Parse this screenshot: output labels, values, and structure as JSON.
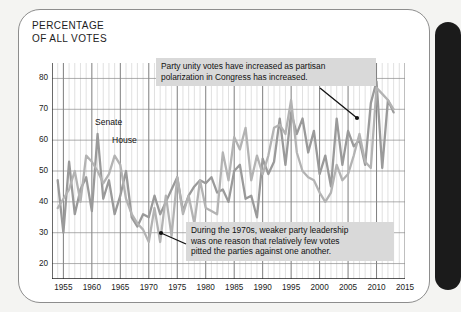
{
  "page": {
    "title_line": "PERCENTAGE\nOF ALL VOTES",
    "binding_color": "#1b1b1b",
    "card_bg": "#ffffff"
  },
  "annotations": [
    {
      "id": "note-polarization",
      "text": "Party unity votes have increased as partisan\npolarization in Congress has increased.",
      "bg": "#d9d9d9"
    },
    {
      "id": "note-1970s",
      "text": "During the 1970s, weaker party leadership\nwas one reason that relatively few votes\npitted the parties against one another.",
      "bg": "#d9d9d9"
    }
  ],
  "series_labels": {
    "senate": "Senate",
    "house": "House"
  },
  "chart_data": {
    "type": "line",
    "title": "PERCENTAGE OF ALL VOTES",
    "xlabel": "",
    "ylabel": "PERCENTAGE OF ALL VOTES",
    "xlim": [
      1953,
      2015
    ],
    "ylim": [
      15,
      85
    ],
    "yticks": [
      20,
      30,
      40,
      50,
      60,
      70,
      80
    ],
    "xticks": [
      1955,
      1960,
      1965,
      1970,
      1975,
      1980,
      1985,
      1990,
      1995,
      2000,
      2005,
      2010,
      2015
    ],
    "grid": "minor-vertical-yearly major-every-5-years horizontal-at-yticks",
    "legend": "inline-labels",
    "x": [
      1954,
      1955,
      1956,
      1957,
      1958,
      1959,
      1960,
      1961,
      1962,
      1963,
      1964,
      1965,
      1966,
      1967,
      1968,
      1969,
      1970,
      1971,
      1972,
      1973,
      1974,
      1975,
      1976,
      1977,
      1978,
      1979,
      1980,
      1981,
      1982,
      1983,
      1984,
      1985,
      1986,
      1987,
      1988,
      1989,
      1990,
      1991,
      1992,
      1993,
      1994,
      1995,
      1996,
      1997,
      1998,
      1999,
      2000,
      2001,
      2002,
      2003,
      2004,
      2005,
      2006,
      2007,
      2008,
      2009,
      2010,
      2011,
      2012,
      2013
    ],
    "series": [
      {
        "name": "Senate",
        "color": "#9a9a9a",
        "values": [
          47,
          30,
          53,
          36,
          44,
          48,
          37,
          62,
          41,
          47,
          36,
          42,
          50,
          35,
          32,
          36,
          35,
          42,
          36,
          40,
          44,
          48,
          37,
          42,
          45,
          47,
          46,
          48,
          43,
          44,
          40,
          50,
          52,
          41,
          42,
          35,
          54,
          49,
          53,
          67,
          52,
          69,
          62,
          67,
          56,
          63,
          49,
          55,
          45,
          67,
          52,
          63,
          58,
          60,
          52,
          72,
          79,
          51,
          73,
          69
        ]
      },
      {
        "name": "House",
        "color": "#b3b3b3",
        "values": [
          38,
          41,
          44,
          50,
          40,
          55,
          53,
          50,
          46,
          49,
          55,
          52,
          41,
          36,
          33,
          31,
          27,
          38,
          27,
          42,
          29,
          48,
          36,
          42,
          33,
          47,
          38,
          37,
          36,
          56,
          47,
          61,
          57,
          64,
          47,
          55,
          49,
          55,
          64,
          65,
          62,
          73,
          56,
          50,
          48,
          47,
          43,
          40,
          43,
          52,
          47,
          49,
          55,
          62,
          53,
          51,
          77,
          75,
          73,
          70
        ]
      }
    ],
    "annotation_arrows": [
      {
        "from": "note-polarization",
        "points_to_year": 2002,
        "points_to_value": 62
      },
      {
        "from": "note-1970s",
        "points_to_year": 1972,
        "points_to_value": 27
      }
    ]
  }
}
